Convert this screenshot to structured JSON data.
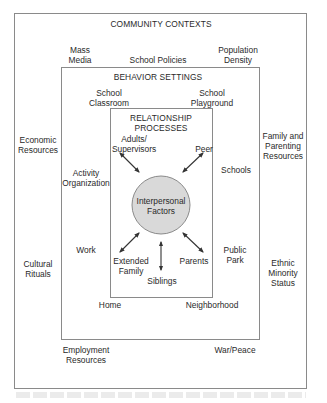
{
  "diagram": {
    "type": "nested ecological model",
    "layers": {
      "community": {
        "title": "COMMUNITY CONTEXTS",
        "items": {
          "mass_media": "Mass\nMedia",
          "school_policies": "School Policies",
          "population_density": "Population\nDensity",
          "economic_resources": "Economic\nResources",
          "family_parenting_resources": "Family and\nParenting\nResources",
          "cultural_rituals": "Cultural\nRituals",
          "ethnic_minority_status": "Ethnic\nMinority\nStatus",
          "employment_resources": "Employment\nResources",
          "war_peace": "War/Peace"
        }
      },
      "behavior": {
        "title": "BEHAVIOR SETTINGS",
        "items": {
          "school_classroom": "School\nClassroom",
          "school_playground": "School\nPlayground",
          "activity_organization": "Activity\nOrganization",
          "schools": "Schools",
          "work": "Work",
          "public_park": "Public\nPark",
          "home": "Home",
          "neighborhood": "Neighborhood"
        }
      },
      "relationship": {
        "title": "RELATIONSHIP\nPROCESSES",
        "items": {
          "adults_supervisors": "Adults/\nSupervisors",
          "peer": "Peer",
          "extended_family": "Extended\nFamily",
          "siblings": "Siblings",
          "parents": "Parents"
        }
      },
      "center": {
        "label": "Interpersonal\nFactors",
        "fill": "#d9d9d9"
      }
    },
    "colors": {
      "border": "#8a8a8a",
      "text": "#2a2a2a",
      "arrow": "#333333"
    }
  }
}
